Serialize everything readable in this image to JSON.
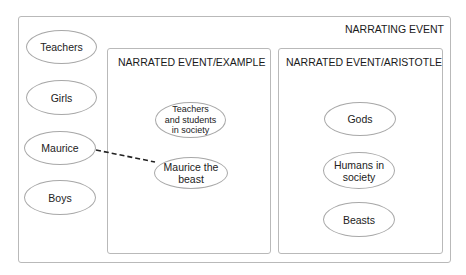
{
  "diagram": {
    "outer": {
      "title": "NARRATING EVENT"
    },
    "left_nodes": [
      {
        "label": "Teachers"
      },
      {
        "label": "Girls"
      },
      {
        "label": "Maurice"
      },
      {
        "label": "Boys"
      }
    ],
    "example_box": {
      "title": "NARRATED EVENT/EXAMPLE",
      "nodes": [
        {
          "label": "Teachers and students in society"
        },
        {
          "label": "Maurice the beast"
        }
      ]
    },
    "aristotle_box": {
      "title": "NARRATED EVENT/ARISTOTLE",
      "nodes": [
        {
          "label": "Gods"
        },
        {
          "label": "Humans in society"
        },
        {
          "label": "Beasts"
        }
      ]
    },
    "links": [
      {
        "from": "Maurice",
        "to": "Maurice the beast",
        "style": "dashed"
      }
    ]
  }
}
